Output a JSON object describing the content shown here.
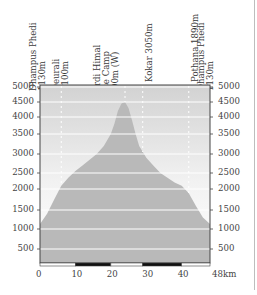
{
  "chart_data": {
    "type": "area",
    "title": "",
    "xlabel": "km",
    "ylabel": "m",
    "xlim": [
      0,
      48
    ],
    "ylim": [
      0,
      5000
    ],
    "x_ticks": [
      "0",
      "10",
      "20",
      "30",
      "40",
      "48km"
    ],
    "y_ticks": [
      "5000",
      "4500",
      "4000",
      "3500",
      "3000",
      "2500",
      "2000",
      "1500",
      "1000",
      "500"
    ],
    "grid": true,
    "x": [
      0,
      2,
      4,
      6,
      8,
      10,
      12,
      14,
      16,
      18,
      20,
      21,
      22,
      23,
      24,
      25,
      26,
      27,
      28,
      30,
      32,
      34,
      36,
      38,
      40,
      42,
      44,
      46,
      48
    ],
    "values": [
      1130,
      1400,
      1750,
      2100,
      2350,
      2550,
      2700,
      2850,
      3000,
      3200,
      3500,
      3800,
      4200,
      4450,
      4500,
      4300,
      3900,
      3500,
      3200,
      2900,
      2700,
      2500,
      2350,
      2200,
      2100,
      1900,
      1600,
      1300,
      1130
    ],
    "waypoints": [
      {
        "name": "Dhampus Phedi 1130m",
        "km": 0,
        "elev": 1130
      },
      {
        "name": "Deurali 2100m",
        "km": 6,
        "elev": 2100
      },
      {
        "name": "Mardi Himal Base Camp 4500m (W)",
        "km": 24,
        "elev": 4500
      },
      {
        "name": "Kokar 3050m",
        "km": 29,
        "elev": 3050
      },
      {
        "name": "Pothana 1890m",
        "km": 42,
        "elev": 1890
      },
      {
        "name": "Dhampus Phedi 1130m",
        "km": 48,
        "elev": 1130
      }
    ]
  },
  "labels": {
    "wp0_l1": "Dhampus Phedi",
    "wp0_l2": "1130m",
    "wp1_l1": "Deurali",
    "wp1_l2": "2100m",
    "wp2_l1": "Mardi Himal",
    "wp2_l2": "Base Camp",
    "wp2_l3": "4500m (W)",
    "wp3_l1": "Kokar 3050m",
    "wp4_l1": "Pothana 1890m",
    "wp5_l1": "Dhampus Phedi",
    "wp5_l2": "1130m"
  },
  "colors": {
    "profile_fill": "#b9b9b9",
    "sky_top": "#d4d4d4",
    "sky_bottom": "#f4f4f4",
    "gridline": "#ffffff",
    "frame": "#444444"
  }
}
